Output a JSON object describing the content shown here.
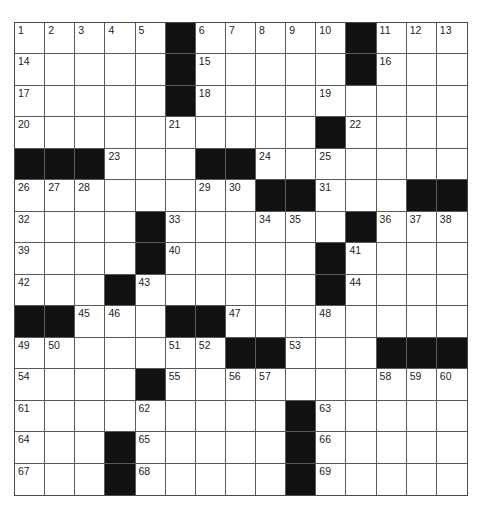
{
  "puzzle": {
    "rows": 15,
    "cols": 15,
    "grid": [
      [
        "1",
        "2",
        "3",
        "4",
        "5",
        "#",
        "6",
        "7",
        "8",
        "9",
        "10",
        "#",
        "11",
        "12",
        "13"
      ],
      [
        "14",
        "",
        "",
        "",
        "",
        "#",
        "15",
        "",
        "",
        "",
        "",
        "#",
        "16",
        "",
        ""
      ],
      [
        "17",
        "",
        "",
        "",
        "",
        "#",
        "18",
        "",
        "",
        "",
        "19",
        "",
        "",
        "",
        ""
      ],
      [
        "20",
        "",
        "",
        "",
        "",
        "21",
        "",
        "",
        "",
        "",
        "#",
        "22",
        "",
        "",
        ""
      ],
      [
        "#",
        "#",
        "#",
        "23",
        "",
        "",
        "#",
        "#",
        "24",
        "",
        "25",
        "",
        "",
        "",
        ""
      ],
      [
        "26",
        "27",
        "28",
        "",
        "",
        "",
        "29",
        "30",
        "#",
        "#",
        "31",
        "",
        "",
        "#",
        "#"
      ],
      [
        "32",
        "",
        "",
        "",
        "#",
        "33",
        "",
        "",
        "34",
        "35",
        "",
        "#",
        "36",
        "37",
        "38"
      ],
      [
        "39",
        "",
        "",
        "",
        "#",
        "40",
        "",
        "",
        "",
        "",
        "#",
        "41",
        "",
        "",
        ""
      ],
      [
        "42",
        "",
        "",
        "#",
        "43",
        "",
        "",
        "",
        "",
        "",
        "#",
        "44",
        "",
        "",
        ""
      ],
      [
        "#",
        "#",
        "45",
        "46",
        "",
        "#",
        "#",
        "47",
        "",
        "",
        "48",
        "",
        "",
        "",
        ""
      ],
      [
        "49",
        "50",
        "",
        "",
        "",
        "51",
        "52",
        "#",
        "#",
        "53",
        "",
        "",
        "#",
        "#",
        "#"
      ],
      [
        "54",
        "",
        "",
        "",
        "#",
        "55",
        "",
        "56",
        "57",
        "",
        "",
        "",
        "58",
        "59",
        "60"
      ],
      [
        "61",
        "",
        "",
        "",
        "62",
        "",
        "",
        "",
        "",
        "#",
        "63",
        "",
        "",
        "",
        ""
      ],
      [
        "64",
        "",
        "",
        "#",
        "65",
        "",
        "",
        "",
        "",
        "#",
        "66",
        "",
        "",
        "",
        ""
      ],
      [
        "67",
        "",
        "",
        "#",
        "68",
        "",
        "",
        "",
        "",
        "#",
        "69",
        "",
        "",
        "",
        ""
      ]
    ]
  },
  "colors": {
    "block": "#111111",
    "line": "#5a5a5a",
    "background": "#ffffff",
    "number": "#222222"
  }
}
